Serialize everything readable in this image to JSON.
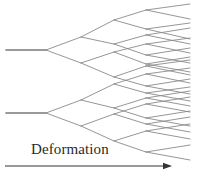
{
  "figure": {
    "name": "branching-deformation-diagram",
    "width": 197,
    "height": 179,
    "background_color": "#ffffff",
    "line_color": "#8a8a8a",
    "line_width": 0.9,
    "text_color": "#2a2a2a"
  },
  "annotation": {
    "deformation_label": "Deformation"
  },
  "axis": {
    "arrow_color": "#333333",
    "x_start": 5,
    "x_end": 172,
    "y": 166
  },
  "chart_data": {
    "type": "diagram",
    "title": "",
    "xlabel": "Deformation",
    "ylabel": "",
    "trunks": 2,
    "branch_levels": 4,
    "trunk_y_values": [
      50,
      113
    ],
    "trunk_x_start": 6,
    "first_fork_x": 46,
    "terminal_x": 190,
    "segments": [
      [
        6,
        50,
        46,
        50
      ],
      [
        6,
        113,
        46,
        113
      ],
      [
        46,
        50,
        81,
        37
      ],
      [
        46,
        50,
        81,
        63
      ],
      [
        46,
        113,
        81,
        100
      ],
      [
        46,
        113,
        81,
        126
      ],
      [
        81,
        37,
        114,
        20
      ],
      [
        81,
        37,
        114,
        44
      ],
      [
        81,
        63,
        114,
        52
      ],
      [
        81,
        63,
        114,
        77
      ],
      [
        81,
        100,
        114,
        84
      ],
      [
        81,
        100,
        114,
        108
      ],
      [
        81,
        126,
        114,
        114
      ],
      [
        81,
        126,
        114,
        141
      ],
      [
        114,
        20,
        146,
        10
      ],
      [
        114,
        20,
        146,
        29
      ],
      [
        114,
        44,
        146,
        35
      ],
      [
        114,
        44,
        146,
        55
      ],
      [
        114,
        52,
        146,
        44
      ],
      [
        114,
        52,
        146,
        64
      ],
      [
        114,
        77,
        146,
        66
      ],
      [
        114,
        77,
        146,
        86
      ],
      [
        114,
        84,
        146,
        74
      ],
      [
        114,
        84,
        146,
        93
      ],
      [
        114,
        108,
        146,
        98
      ],
      [
        114,
        108,
        146,
        118
      ],
      [
        114,
        114,
        146,
        104
      ],
      [
        114,
        114,
        146,
        124
      ],
      [
        114,
        141,
        146,
        131
      ],
      [
        114,
        141,
        146,
        152
      ],
      [
        146,
        10,
        190,
        4
      ],
      [
        146,
        10,
        190,
        19
      ],
      [
        146,
        29,
        190,
        23
      ],
      [
        146,
        29,
        190,
        39
      ],
      [
        146,
        35,
        190,
        28
      ],
      [
        146,
        35,
        190,
        44
      ],
      [
        146,
        55,
        190,
        48
      ],
      [
        146,
        55,
        190,
        63
      ],
      [
        146,
        44,
        190,
        38
      ],
      [
        146,
        44,
        190,
        53
      ],
      [
        146,
        64,
        190,
        57
      ],
      [
        146,
        64,
        190,
        72
      ],
      [
        146,
        66,
        190,
        60
      ],
      [
        146,
        66,
        190,
        75
      ],
      [
        146,
        86,
        190,
        79
      ],
      [
        146,
        86,
        190,
        94
      ],
      [
        146,
        74,
        190,
        68
      ],
      [
        146,
        74,
        190,
        83
      ],
      [
        146,
        93,
        190,
        87
      ],
      [
        146,
        93,
        190,
        101
      ],
      [
        146,
        98,
        190,
        91
      ],
      [
        146,
        98,
        190,
        106
      ],
      [
        146,
        118,
        190,
        111
      ],
      [
        146,
        118,
        190,
        126
      ],
      [
        146,
        104,
        190,
        97
      ],
      [
        146,
        104,
        190,
        112
      ],
      [
        146,
        124,
        190,
        117
      ],
      [
        146,
        124,
        190,
        132
      ],
      [
        146,
        131,
        190,
        124
      ],
      [
        146,
        131,
        190,
        139
      ],
      [
        146,
        152,
        190,
        145
      ],
      [
        146,
        152,
        190,
        160
      ]
    ],
    "trunk_caps": [
      [
        6,
        50,
        46,
        50
      ],
      [
        6,
        113,
        46,
        113
      ]
    ],
    "grid": false,
    "legend": null
  }
}
